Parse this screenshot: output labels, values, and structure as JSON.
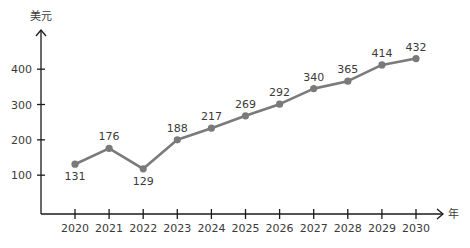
{
  "chart_data": {
    "type": "line",
    "title": "",
    "xlabel": "年",
    "ylabel": "美元",
    "categories": [
      "2020",
      "2021",
      "2022",
      "2023",
      "2024",
      "2025",
      "2026",
      "2027",
      "2028",
      "2029",
      "2030"
    ],
    "series": [
      {
        "name": "美元",
        "values": [
          131,
          176,
          129,
          188,
          217,
          269,
          292,
          340,
          365,
          414,
          432
        ],
        "plotted_values": [
          131,
          176,
          118,
          200,
          233,
          268,
          301,
          345,
          366,
          412,
          430
        ]
      }
    ],
    "yticks": [
      100,
      200,
      300,
      400
    ],
    "ylim": [
      0,
      500
    ],
    "grid": false,
    "legend": "none",
    "colors": {
      "line": "#7a7a7a",
      "marker": "#7a7a7a",
      "axis": "#1a1a1a",
      "text": "#3a3a3a"
    }
  }
}
